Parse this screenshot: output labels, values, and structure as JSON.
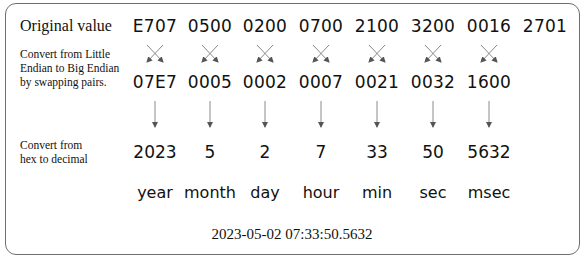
{
  "labels": {
    "original": "Original value",
    "swap": [
      "Convert from Little",
      "Endian to Big Endian",
      "by swapping pairs."
    ],
    "decimal": [
      "Convert from",
      "hex to decimal"
    ]
  },
  "original_values": [
    "E707",
    "0500",
    "0200",
    "0700",
    "2100",
    "3200",
    "0016",
    "2701"
  ],
  "big_endian_values": [
    "07E7",
    "0005",
    "0002",
    "0007",
    "0021",
    "0032",
    "1600"
  ],
  "decimal_values": [
    "2023",
    "5",
    "2",
    "7",
    "33",
    "50",
    "5632"
  ],
  "units": [
    "year",
    "month",
    "day",
    "hour",
    "min",
    "sec",
    "msec"
  ],
  "result": "2023-05-02  07:33:50.5632",
  "colors": {
    "border": "#6f6f6f",
    "arrow": "#555555",
    "text": "#111111"
  }
}
